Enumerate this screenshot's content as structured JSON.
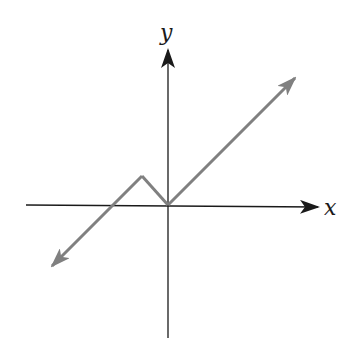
{
  "axes": {
    "x_label": "x",
    "y_label": "y",
    "axis_color": "#1a1a1a"
  },
  "graph": {
    "description": "Absolute-value-like piecewise linear graph with arrows at both ends",
    "line_color": "#808080",
    "vertices": [
      [
        -2.5,
        -1.3
      ],
      [
        -0.6,
        0.6
      ],
      [
        0,
        0
      ],
      [
        2.6,
        2.6
      ]
    ]
  }
}
